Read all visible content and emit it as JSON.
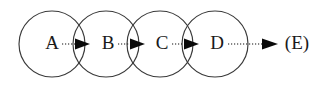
{
  "figure": {
    "title": "",
    "kind": "chain-of-overlapping-circles-diagram",
    "background_color": "#ffffff",
    "stroke_color": "#3a3a3a",
    "arrow_color": "#0a0a0a",
    "text_color": "#1a1a1a"
  },
  "nodes": [
    {
      "id": "A",
      "label": "A",
      "cx": 52,
      "cy": 44,
      "r": 33,
      "label_x": 52,
      "label_y": 45
    },
    {
      "id": "B",
      "label": "B",
      "cx": 106,
      "cy": 44,
      "r": 33,
      "label_x": 108,
      "label_y": 45
    },
    {
      "id": "C",
      "label": "C",
      "cx": 160,
      "cy": 44,
      "r": 33,
      "label_x": 162,
      "label_y": 45
    },
    {
      "id": "D",
      "label": "D",
      "cx": 215,
      "cy": 44,
      "r": 33,
      "label_x": 217,
      "label_y": 45
    }
  ],
  "terminal": {
    "id": "E",
    "label": "(E)",
    "label_x": 297,
    "label_y": 45
  },
  "links": [
    {
      "id": "A-B",
      "from": "A",
      "to": "B",
      "x1": 62,
      "x2": 83,
      "y": 44,
      "style": "dotted",
      "head": "filled-triangle"
    },
    {
      "id": "B-C",
      "from": "B",
      "to": "C",
      "x1": 118,
      "x2": 138,
      "y": 44,
      "style": "dotted",
      "head": "filled-triangle"
    },
    {
      "id": "C-D",
      "from": "C",
      "to": "D",
      "x1": 172,
      "x2": 192,
      "y": 44,
      "style": "dotted",
      "head": "filled-triangle"
    },
    {
      "id": "D-E",
      "from": "D",
      "to": "E",
      "x1": 228,
      "x2": 270,
      "y": 44,
      "style": "dotted",
      "head": "filled-triangle"
    }
  ]
}
